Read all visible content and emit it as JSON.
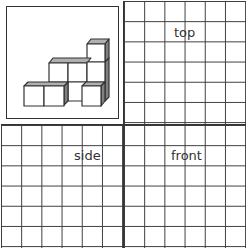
{
  "diagram": {
    "figure_description": "Isometric arrangement of unit cubes: front row of 3 cubes with a recessed gap, middle row of 3 cubes, one cube stacked on top at the right",
    "views": [
      {
        "id": "top",
        "label": "top",
        "grid": {
          "cols": 6,
          "rows": 6
        }
      },
      {
        "id": "side",
        "label": "side",
        "grid": {
          "cols": 6,
          "rows": 6
        }
      },
      {
        "id": "front",
        "label": "front",
        "grid": {
          "cols": 6,
          "rows": 6
        }
      }
    ],
    "colors": {
      "line": "#333333",
      "shade": "#808080",
      "top_face": "#b0b0b0",
      "face": "#ffffff"
    }
  }
}
